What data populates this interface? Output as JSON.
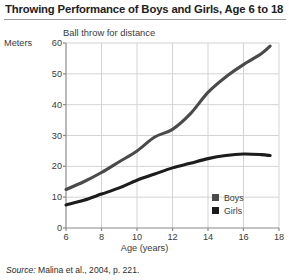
{
  "title": "Throwing Performance of Boys and Girls, Age 6 to 18",
  "subtitle": "Ball throw for distance",
  "ylabel": "Meters",
  "xlabel": "Age (years)",
  "source": {
    "prefix": "Source:",
    "text": "Malina et al., 2004, p. 221."
  },
  "legend": [
    {
      "label": "Boys",
      "color": "#4a4a4a"
    },
    {
      "label": "Girls",
      "color": "#1c1c1c"
    }
  ],
  "colors": {
    "boys_line": "#4a4a4a",
    "girls_line": "#1c1c1c",
    "grid": "#d3d3d3",
    "axis": "#8a8a8a",
    "text": "#3a3a3a",
    "title": "#212121",
    "background": "#ffffff"
  },
  "chart_data": {
    "type": "line",
    "title": "Throwing Performance of Boys and Girls, Age 6 to 18",
    "subtitle": "Ball throw for distance",
    "xlabel": "Age (years)",
    "ylabel": "Meters",
    "xlim": [
      6,
      18
    ],
    "ylim": [
      0,
      60
    ],
    "xticks": [
      6,
      8,
      10,
      12,
      14,
      16,
      18
    ],
    "yticks": [
      0,
      10,
      20,
      30,
      40,
      50,
      60
    ],
    "grid": true,
    "legend_position": "inside-bottom-right",
    "x": [
      6,
      7,
      8,
      9,
      10,
      11,
      12,
      13,
      14,
      15,
      16,
      17,
      17.5
    ],
    "series": [
      {
        "name": "Boys",
        "color": "#4a4a4a",
        "values": [
          12.5,
          15,
          18,
          21.5,
          25,
          29.5,
          32,
          37,
          44,
          49,
          53,
          56.5,
          59
        ]
      },
      {
        "name": "Girls",
        "color": "#1c1c1c",
        "values": [
          7.5,
          9,
          11,
          13,
          15.5,
          17.5,
          19.5,
          21,
          22.5,
          23.5,
          24,
          23.8,
          23.5
        ]
      }
    ]
  }
}
